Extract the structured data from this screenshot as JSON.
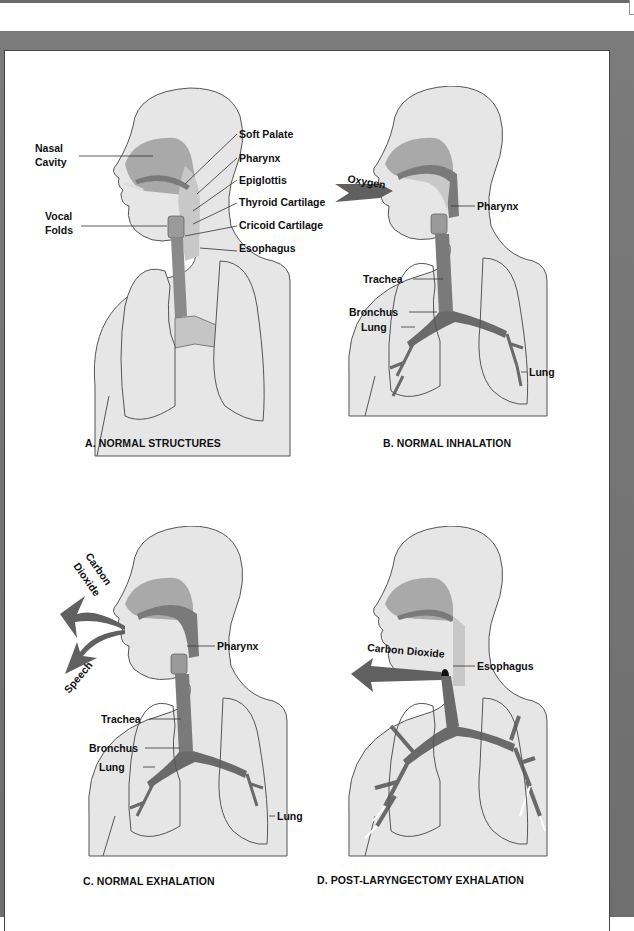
{
  "figure": {
    "panels": [
      {
        "id": "A",
        "caption": "A. NORMAL STRUCTURES",
        "labels": {
          "nasal_cavity_1": "Nasal",
          "nasal_cavity_2": "Cavity",
          "vocal_folds_1": "Vocal",
          "vocal_folds_2": "Folds",
          "soft_palate": "Soft Palate",
          "pharynx": "Pharynx",
          "epiglottis": "Epiglottis",
          "thyroid_cartilage": "Thyroid Cartilage",
          "cricoid_cartilage": "Cricoid Cartilage",
          "esophagus": "Esophagus"
        }
      },
      {
        "id": "B",
        "caption": "B. NORMAL INHALATION",
        "labels": {
          "oxygen": "Oxygen",
          "pharynx": "Pharynx",
          "trachea": "Trachea",
          "bronchus": "Bronchus",
          "lung_left": "Lung",
          "lung_right": "Lung"
        }
      },
      {
        "id": "C",
        "caption": "C. NORMAL EXHALATION",
        "labels": {
          "carbon": "Carbon",
          "dioxide": "Dioxide",
          "speech": "Speech",
          "pharynx": "Pharynx",
          "trachea": "Trachea",
          "bronchus": "Bronchus",
          "lung_left": "Lung",
          "lung_right": "Lung"
        }
      },
      {
        "id": "D",
        "caption": "D. POST-LARYNGECTOMY EXHALATION",
        "labels": {
          "carbon_dioxide": "Carbon Dioxide",
          "esophagus": "Esophagus"
        }
      }
    ],
    "colors": {
      "body_fill": "#e6e6e6",
      "outline": "#555555",
      "airway_dark": "#6e6e6e",
      "airway_mid": "#9a9a9a",
      "nasal_fill": "#a9a9a9",
      "arrow": "#606060",
      "frame": "#737373"
    }
  }
}
